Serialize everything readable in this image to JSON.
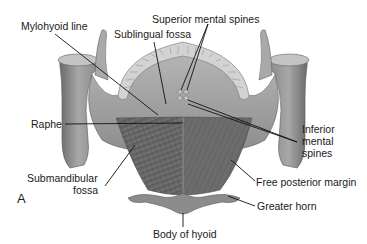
{
  "figure": {
    "panel_letter": "A",
    "colors": {
      "background": "#ffffff",
      "bone_light": "#b5b5b5",
      "bone_mid": "#8f8f8f",
      "bone_dark": "#5e5e5e",
      "muscle": "#6f6f6f",
      "muscle_dark": "#4e4e4e",
      "teeth": "#cfcfcf",
      "leader_line": "#111111",
      "label_text": "#1a1a1a"
    },
    "labels": {
      "mylohyoid_line": "Mylohyoid line",
      "superior_mental_spines": "Superior mental spines",
      "sublingual_fossa": "Sublingual fossa",
      "raphe": "Raphe",
      "inferior_mental_spines_1": "Inferior",
      "inferior_mental_spines_2": "mental",
      "inferior_mental_spines_3": "spines",
      "submandibular_fossa_1": "Submandibular",
      "submandibular_fossa_2": "fossa",
      "free_posterior_margin": "Free posterior margin",
      "body_of_hyoid": "Body of hyoid",
      "greater_horn": "Greater horn"
    }
  }
}
